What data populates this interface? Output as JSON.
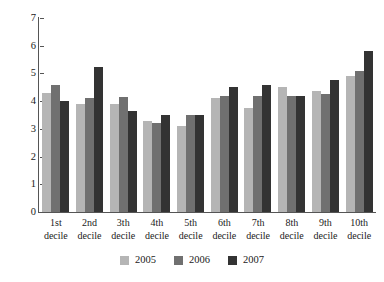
{
  "chart_data": {
    "type": "bar",
    "title": "",
    "subtitle": "",
    "xlabel": "",
    "ylabel": "",
    "ylim": [
      0,
      7
    ],
    "yticks": [
      0,
      1,
      2,
      3,
      4,
      5,
      6,
      7
    ],
    "grid": false,
    "legend_position": "bottom-center",
    "categories": [
      "1st decile",
      "2nd decile",
      "3th decile",
      "4th decile",
      "5th decile",
      "6th decile",
      "7th decile",
      "8th decile",
      "9th decile",
      "10th decile"
    ],
    "category_lines": [
      [
        "1st",
        "decile"
      ],
      [
        "2nd",
        "decile"
      ],
      [
        "3th",
        "decile"
      ],
      [
        "4th",
        "decile"
      ],
      [
        "5th",
        "decile"
      ],
      [
        "6th",
        "decile"
      ],
      [
        "7th",
        "decile"
      ],
      [
        "8th",
        "decile"
      ],
      [
        "9th",
        "decile"
      ],
      [
        "10th",
        "decile"
      ]
    ],
    "series": [
      {
        "name": "2005",
        "color": "#b5b5b5",
        "values": [
          4.3,
          3.9,
          3.9,
          3.3,
          3.1,
          4.1,
          3.75,
          4.5,
          4.35,
          4.9
        ]
      },
      {
        "name": "2006",
        "color": "#707070",
        "values": [
          4.6,
          4.1,
          4.15,
          3.2,
          3.5,
          4.2,
          4.2,
          4.2,
          4.25,
          5.1
        ]
      },
      {
        "name": "2007",
        "color": "#333333",
        "values": [
          4.0,
          5.25,
          3.65,
          3.5,
          3.5,
          4.5,
          4.6,
          4.2,
          4.75,
          5.8
        ]
      }
    ]
  },
  "legend": {
    "items": [
      {
        "label": "2005",
        "color": "#b5b5b5"
      },
      {
        "label": "2006",
        "color": "#707070"
      },
      {
        "label": "2007",
        "color": "#333333"
      }
    ]
  },
  "axis": {
    "y_tick_labels": [
      "7",
      "6",
      "5",
      "4",
      "3",
      "2",
      "1",
      "0"
    ]
  },
  "colors": {
    "axis_line": "#555555",
    "text": "#1a1a1a",
    "background": "#ffffff"
  }
}
